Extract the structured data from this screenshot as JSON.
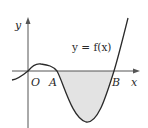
{
  "diagram": {
    "type": "function-graph",
    "function_label": "y = f(x)",
    "axis_labels": {
      "x": "x",
      "y": "y"
    },
    "point_labels": {
      "origin": "O",
      "a": "A",
      "b": "B"
    },
    "shaded_region": "area between curve and x-axis from A to B (below x-axis)",
    "colors": {
      "curve": "#2a2a2a",
      "axis": "#555555",
      "shade": "#e3e3e3",
      "text": "#2a2a2a"
    }
  }
}
